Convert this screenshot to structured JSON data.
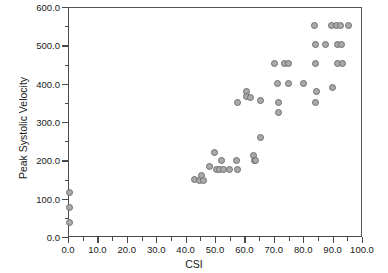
{
  "chart_data": {
    "type": "scatter",
    "title": "",
    "xlabel": "CSI",
    "ylabel": "Peak Systolic Velocity",
    "xlim": [
      0,
      100
    ],
    "ylim": [
      0,
      600
    ],
    "xticks": [
      0,
      10,
      20,
      30,
      40,
      50,
      60,
      70,
      80,
      90,
      100
    ],
    "xticklabels": [
      "0.0",
      "10.0",
      "20.0",
      "30.0",
      "40.0",
      "50.0",
      "60.0",
      "70.0",
      "80.0",
      "90.0",
      "100.0"
    ],
    "yticks": [
      0,
      100,
      200,
      300,
      400,
      500,
      600
    ],
    "yticklabels": [
      "0.0",
      "100.0",
      "200.0",
      "300.0",
      "400.0",
      "500.0",
      "600.0"
    ],
    "x_minor_step": 5,
    "y_minor_step": 50,
    "grid": false,
    "legend": null,
    "marker": {
      "shape": "circle",
      "fill": "#a9a9a9",
      "edge": "#6f6f6f",
      "size_px": 7
    },
    "points": [
      {
        "x": 0.0,
        "y": 120
      },
      {
        "x": 0.0,
        "y": 80
      },
      {
        "x": 0.0,
        "y": 40
      },
      {
        "x": 42.8,
        "y": 152
      },
      {
        "x": 44.3,
        "y": 150
      },
      {
        "x": 45.2,
        "y": 162
      },
      {
        "x": 45.6,
        "y": 150
      },
      {
        "x": 47.9,
        "y": 186
      },
      {
        "x": 49.6,
        "y": 222
      },
      {
        "x": 50.1,
        "y": 180
      },
      {
        "x": 51.3,
        "y": 178
      },
      {
        "x": 51.8,
        "y": 202
      },
      {
        "x": 52.4,
        "y": 180
      },
      {
        "x": 54.6,
        "y": 180
      },
      {
        "x": 56.9,
        "y": 203
      },
      {
        "x": 57.2,
        "y": 178
      },
      {
        "x": 57.4,
        "y": 353
      },
      {
        "x": 60.3,
        "y": 381
      },
      {
        "x": 60.4,
        "y": 370
      },
      {
        "x": 61.8,
        "y": 366
      },
      {
        "x": 62.6,
        "y": 214
      },
      {
        "x": 63.0,
        "y": 203
      },
      {
        "x": 63.3,
        "y": 202
      },
      {
        "x": 65.0,
        "y": 360
      },
      {
        "x": 65.1,
        "y": 262
      },
      {
        "x": 69.8,
        "y": 455
      },
      {
        "x": 71.0,
        "y": 404
      },
      {
        "x": 71.2,
        "y": 353
      },
      {
        "x": 71.3,
        "y": 328
      },
      {
        "x": 73.2,
        "y": 455
      },
      {
        "x": 74.5,
        "y": 455
      },
      {
        "x": 74.6,
        "y": 404
      },
      {
        "x": 79.7,
        "y": 404
      },
      {
        "x": 83.6,
        "y": 555
      },
      {
        "x": 83.8,
        "y": 505
      },
      {
        "x": 83.9,
        "y": 455
      },
      {
        "x": 83.9,
        "y": 353
      },
      {
        "x": 84.2,
        "y": 382
      },
      {
        "x": 87.3,
        "y": 505
      },
      {
        "x": 89.3,
        "y": 555
      },
      {
        "x": 89.5,
        "y": 392
      },
      {
        "x": 91.0,
        "y": 555
      },
      {
        "x": 91.2,
        "y": 505
      },
      {
        "x": 91.3,
        "y": 455
      },
      {
        "x": 92.3,
        "y": 555
      },
      {
        "x": 92.8,
        "y": 505
      },
      {
        "x": 93.0,
        "y": 455
      },
      {
        "x": 95.0,
        "y": 555
      }
    ]
  }
}
